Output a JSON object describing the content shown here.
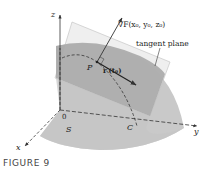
{
  "figure": {
    "caption": "FIGURE 9",
    "labels": {
      "z_axis": "z",
      "x_axis": "x",
      "y_axis": "y",
      "origin": "0",
      "surface": "S",
      "curve": "C",
      "point": "P",
      "gradient": "∇F(x₀, y₀, z₀)",
      "tangent_vector": "r′(t₀)",
      "tangent_plane": "tangent plane"
    },
    "colors": {
      "surface": "#c8c8c8",
      "surface_band": "#a9a9a9",
      "plane": "#e6e6e6",
      "axis": "#333333",
      "text": "#222222"
    }
  }
}
